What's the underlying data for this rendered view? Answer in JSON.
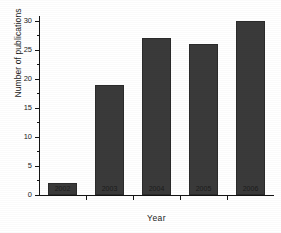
{
  "figure": {
    "background_color": "#ffffff",
    "bar_color": "#3a3a3a",
    "axis_color": "#141414",
    "text_color": "#1c1c1c"
  },
  "chart_data": {
    "type": "bar",
    "title": "",
    "xlabel": "Year",
    "ylabel": "Number of publications",
    "categories": [
      "2002",
      "2003",
      "2004",
      "2005",
      "2006"
    ],
    "values": [
      2,
      19,
      27,
      26,
      30
    ],
    "series": [
      {
        "name": "Number of publications",
        "values": [
          2,
          19,
          27,
          26,
          30
        ]
      }
    ],
    "ylim": [
      0,
      31
    ],
    "xlim": [
      0,
      5
    ],
    "yticks": [
      0,
      5,
      10,
      15,
      20,
      25,
      30
    ],
    "ytick_labels": [
      "0",
      "5",
      "10",
      "15",
      "20",
      "25",
      "30"
    ],
    "xtick_labels": [
      "2002",
      "2003",
      "2004",
      "2005",
      "2006"
    ],
    "grid": false,
    "legend": false,
    "legend_position": "none",
    "annotations": []
  }
}
